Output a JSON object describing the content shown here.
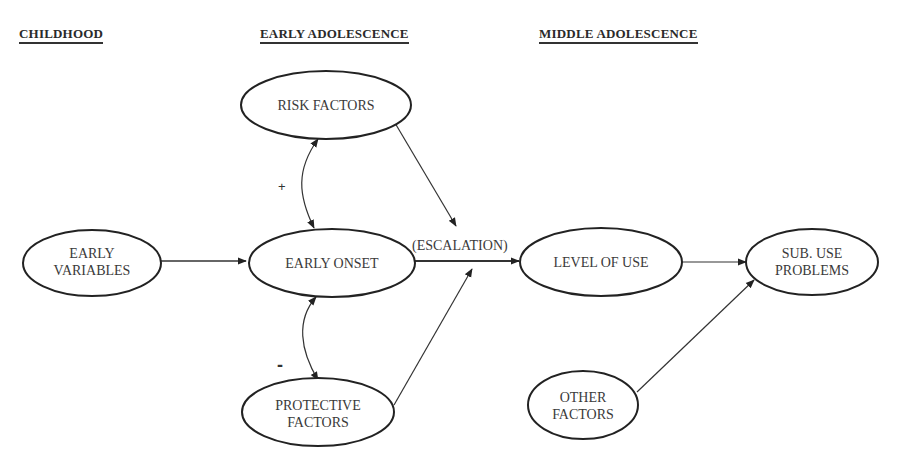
{
  "headings": {
    "childhood": "CHILDHOOD",
    "early_adolescence": "EARLY ADOLESCENCE",
    "middle_adolescence": "MIDDLE ADOLESCENCE"
  },
  "nodes": {
    "risk_factors": {
      "lines": [
        "RISK FACTORS"
      ]
    },
    "early_variables": {
      "lines": [
        "EARLY",
        "VARIABLES"
      ]
    },
    "early_onset": {
      "lines": [
        "EARLY ONSET"
      ]
    },
    "protective_factors": {
      "lines": [
        "PROTECTIVE",
        "FACTORS"
      ]
    },
    "level_of_use": {
      "lines": [
        "LEVEL OF USE"
      ]
    },
    "sub_use_problems": {
      "lines": [
        "SUB. USE",
        "PROBLEMS"
      ]
    },
    "other_factors": {
      "lines": [
        "OTHER",
        "FACTORS"
      ]
    }
  },
  "edge_labels": {
    "escalation": "(ESCALATION)",
    "positive": "+",
    "negative": "-"
  },
  "colors": {
    "stroke": "#222222",
    "text": "#3a3a3a",
    "background": "#ffffff"
  }
}
